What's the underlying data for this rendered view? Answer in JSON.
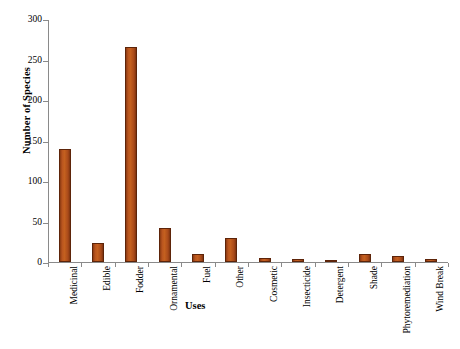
{
  "chart_data": {
    "type": "bar",
    "title": "",
    "xlabel": "Uses",
    "ylabel": "Number of Species",
    "ylim": [
      0,
      300
    ],
    "yticks": [
      0,
      50,
      100,
      150,
      200,
      250,
      300
    ],
    "grid": false,
    "legend": "none",
    "bar_color": "#b9551f",
    "bar_edge_color": "#5d2409",
    "categories": [
      "Medicinal",
      "Edible",
      "Fodder",
      "Ornamental",
      "Fuel",
      "Other",
      "Cosmetic",
      "Insecticide",
      "Detergent",
      "Shade",
      "Phytoremediation",
      "Wind Break"
    ],
    "values": [
      139,
      23,
      265,
      42,
      10,
      30,
      5,
      4,
      3,
      10,
      7,
      4
    ]
  }
}
